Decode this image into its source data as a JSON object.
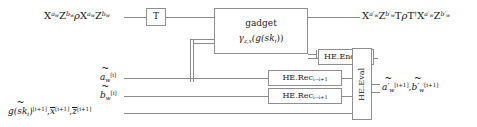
{
  "figure": {
    "type": "quantum-circuit-diagram",
    "title": "",
    "colors": {
      "wire": "#8c8c8c",
      "box_border": "#8e8e8e",
      "text": "#141414",
      "background": "#ffffff"
    }
  },
  "inputs": {
    "top_state": {
      "X1": "X",
      "X1_exp": "a",
      "X1_exp_sub": "w",
      "Z1": "Z",
      "Z1_exp": "b",
      "Z1_exp_sub": "w",
      "rho": "ρ",
      "X2": "X",
      "X2_exp": "a",
      "X2_exp_sub": "w",
      "Z2": "Z",
      "Z2_exp": "b",
      "Z2_exp_sub": "w"
    },
    "wire_a": {
      "base": "a",
      "base_sub": "w",
      "sup": "[i]",
      "accent": "tilde"
    },
    "wire_b": {
      "base": "b",
      "base_sub": "w",
      "sup": "[i]",
      "accent": "tilde"
    },
    "wire_bottom": {
      "term1_base": "g(sk",
      "term1_sub": "i",
      "term1_close": ")",
      "term1_sup": "[i+1]",
      "term2_base": "x",
      "term2_sup": "[i+1]",
      "term3_base": "z",
      "term3_sup": "[i+1]"
    }
  },
  "gates": {
    "t_gate": {
      "label": "T"
    },
    "gadget": {
      "line1": "gadget",
      "line2_gamma": "γ",
      "line2_gamma_sub": "z,x",
      "line2_rest": "(g(sk",
      "line2_sub": "i",
      "line2_tail": "))"
    },
    "he_enc": {
      "name": "HE.Enc",
      "sub_pk": "pk",
      "sub_index": "i+1"
    },
    "he_rec_1": {
      "name": "HE.Rec",
      "sub": "i→i+1"
    },
    "he_rec_2": {
      "name": "HE.Rec",
      "sub": "i→i+1"
    },
    "he_eval": {
      "name": "HE.Eval"
    }
  },
  "outputs": {
    "top_state": {
      "X1": "X",
      "X1_exp": "a",
      "X1_exp_prime": "′",
      "X1_exp_sub": "w",
      "Z1": "Z",
      "Z1_exp": "b",
      "Z1_exp_prime": "′",
      "Z1_exp_sub": "w",
      "T1": "T",
      "rho": "ρ",
      "T2": "T",
      "T2_dag": "†",
      "X2": "X",
      "X2_exp": "a",
      "X2_exp_prime": "′",
      "X2_exp_sub": "w",
      "Z2": "Z",
      "Z2_exp": "b",
      "Z2_exp_prime": "′",
      "Z2_exp_sub": "w"
    },
    "wire_a": {
      "base": "a",
      "prime": "′",
      "base_sub": "w",
      "sup": "[i+1]",
      "accent": "tilde"
    },
    "wire_b": {
      "base": "b",
      "prime": "′",
      "base_sub": "w",
      "sup": "[i+1]",
      "accent": "tilde"
    }
  },
  "separators": {
    "comma": ","
  }
}
